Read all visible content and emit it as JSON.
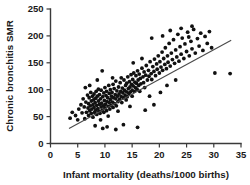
{
  "chart_data": {
    "type": "scatter",
    "title": "",
    "xlabel": "Infant mortality (deaths/1000 births)",
    "ylabel": "Chronic bronchitis SMR",
    "xlim": [
      0,
      35
    ],
    "ylim": [
      0,
      250
    ],
    "xticks": [
      0,
      5,
      10,
      15,
      20,
      25,
      30,
      35
    ],
    "yticks": [
      0,
      50,
      100,
      150,
      200,
      250
    ],
    "grid": false,
    "legend": null,
    "point_color": "#111111",
    "line_color": "#4a4a4a",
    "marker_size": 1.9,
    "fit_line": {
      "label": "linear regression",
      "x_start": 3.4,
      "y_start": 28,
      "x_end": 33.2,
      "y_end": 192
    },
    "points": [
      [
        3.6,
        47
      ],
      [
        4.6,
        52
      ],
      [
        5.2,
        64
      ],
      [
        5.6,
        72
      ],
      [
        5.8,
        57
      ],
      [
        6.0,
        83
      ],
      [
        6.2,
        68
      ],
      [
        6.3,
        46
      ],
      [
        6.5,
        77
      ],
      [
        6.6,
        58
      ],
      [
        6.8,
        90
      ],
      [
        6.9,
        66
      ],
      [
        7.0,
        74
      ],
      [
        7.0,
        52
      ],
      [
        7.1,
        85
      ],
      [
        7.2,
        61
      ],
      [
        7.3,
        70
      ],
      [
        7.4,
        95
      ],
      [
        7.5,
        56
      ],
      [
        7.5,
        79
      ],
      [
        7.6,
        64
      ],
      [
        7.7,
        88
      ],
      [
        7.8,
        72
      ],
      [
        7.8,
        49
      ],
      [
        7.9,
        81
      ],
      [
        8.0,
        67
      ],
      [
        8.0,
        92
      ],
      [
        8.1,
        58
      ],
      [
        8.2,
        76
      ],
      [
        8.3,
        84
      ],
      [
        8.3,
        62
      ],
      [
        8.4,
        97
      ],
      [
        8.5,
        71
      ],
      [
        8.5,
        54
      ],
      [
        8.6,
        88
      ],
      [
        8.7,
        65
      ],
      [
        8.8,
        79
      ],
      [
        8.8,
        101
      ],
      [
        8.9,
        60
      ],
      [
        9.0,
        73
      ],
      [
        9.0,
        91
      ],
      [
        9.1,
        56
      ],
      [
        9.2,
        83
      ],
      [
        9.3,
        68
      ],
      [
        9.3,
        99
      ],
      [
        9.4,
        75
      ],
      [
        9.5,
        62
      ],
      [
        9.5,
        135
      ],
      [
        9.6,
        87
      ],
      [
        9.7,
        70
      ],
      [
        9.8,
        94
      ],
      [
        9.8,
        58
      ],
      [
        9.9,
        80
      ],
      [
        10.0,
        66
      ],
      [
        10.0,
        104
      ],
      [
        10.1,
        73
      ],
      [
        10.2,
        89
      ],
      [
        10.3,
        61
      ],
      [
        10.3,
        97
      ],
      [
        10.4,
        78
      ],
      [
        10.5,
        85
      ],
      [
        10.6,
        69
      ],
      [
        10.7,
        108
      ],
      [
        10.8,
        76
      ],
      [
        10.8,
        93
      ],
      [
        10.9,
        64
      ],
      [
        11.0,
        82
      ],
      [
        11.0,
        100
      ],
      [
        11.1,
        71
      ],
      [
        11.2,
        88
      ],
      [
        11.3,
        95
      ],
      [
        11.4,
        77
      ],
      [
        11.5,
        110
      ],
      [
        11.5,
        67
      ],
      [
        11.6,
        85
      ],
      [
        11.7,
        102
      ],
      [
        11.8,
        74
      ],
      [
        11.9,
        91
      ],
      [
        12.0,
        83
      ],
      [
        12.0,
        116
      ],
      [
        12.1,
        70
      ],
      [
        12.2,
        98
      ],
      [
        12.3,
        88
      ],
      [
        12.4,
        78
      ],
      [
        12.5,
        105
      ],
      [
        12.6,
        92
      ],
      [
        12.7,
        82
      ],
      [
        12.8,
        113
      ],
      [
        12.9,
        97
      ],
      [
        13.0,
        87
      ],
      [
        13.0,
        122
      ],
      [
        13.1,
        76
      ],
      [
        13.2,
        103
      ],
      [
        13.3,
        94
      ],
      [
        13.4,
        85
      ],
      [
        13.5,
        118
      ],
      [
        13.6,
        99
      ],
      [
        13.7,
        90
      ],
      [
        13.8,
        108
      ],
      [
        13.9,
        81
      ],
      [
        14.0,
        112
      ],
      [
        14.0,
        96
      ],
      [
        14.1,
        87
      ],
      [
        14.2,
        124
      ],
      [
        14.3,
        102
      ],
      [
        14.4,
        93
      ],
      [
        14.5,
        115
      ],
      [
        14.6,
        105
      ],
      [
        14.7,
        96
      ],
      [
        14.8,
        128
      ],
      [
        14.9,
        110
      ],
      [
        15.0,
        99
      ],
      [
        15.0,
        88
      ],
      [
        15.1,
        119
      ],
      [
        15.2,
        107
      ],
      [
        15.3,
        131
      ],
      [
        15.4,
        97
      ],
      [
        15.5,
        114
      ],
      [
        15.6,
        104
      ],
      [
        15.7,
        126
      ],
      [
        15.8,
        112
      ],
      [
        15.9,
        101
      ],
      [
        16.0,
        135
      ],
      [
        16.1,
        118
      ],
      [
        16.2,
        108
      ],
      [
        16.3,
        129
      ],
      [
        16.4,
        97
      ],
      [
        16.5,
        121
      ],
      [
        16.6,
        111
      ],
      [
        16.8,
        140
      ],
      [
        17.0,
        124
      ],
      [
        17.1,
        113
      ],
      [
        17.2,
        133
      ],
      [
        17.3,
        104
      ],
      [
        17.5,
        127
      ],
      [
        17.6,
        145
      ],
      [
        17.8,
        118
      ],
      [
        18.0,
        136
      ],
      [
        18.1,
        125
      ],
      [
        18.3,
        152
      ],
      [
        18.5,
        130
      ],
      [
        18.6,
        119
      ],
      [
        18.8,
        143
      ],
      [
        19.0,
        134
      ],
      [
        19.1,
        157
      ],
      [
        19.3,
        126
      ],
      [
        19.5,
        148
      ],
      [
        19.6,
        138
      ],
      [
        19.8,
        163
      ],
      [
        20.0,
        131
      ],
      [
        20.1,
        152
      ],
      [
        20.3,
        142
      ],
      [
        20.5,
        170
      ],
      [
        20.6,
        136
      ],
      [
        20.8,
        158
      ],
      [
        21.0,
        147
      ],
      [
        21.1,
        178
      ],
      [
        21.3,
        139
      ],
      [
        21.5,
        163
      ],
      [
        21.6,
        151
      ],
      [
        21.8,
        186
      ],
      [
        22.0,
        144
      ],
      [
        22.2,
        168
      ],
      [
        22.4,
        156
      ],
      [
        22.6,
        193
      ],
      [
        22.8,
        149
      ],
      [
        23.0,
        174
      ],
      [
        23.2,
        161
      ],
      [
        23.4,
        203
      ],
      [
        23.6,
        153
      ],
      [
        23.8,
        180
      ],
      [
        24.0,
        166
      ],
      [
        24.2,
        196
      ],
      [
        24.5,
        158
      ],
      [
        24.7,
        185
      ],
      [
        25.0,
        171
      ],
      [
        25.2,
        207
      ],
      [
        25.5,
        163
      ],
      [
        25.8,
        190
      ],
      [
        26.0,
        176
      ],
      [
        26.3,
        212
      ],
      [
        26.6,
        168
      ],
      [
        27.0,
        195
      ],
      [
        27.3,
        181
      ],
      [
        27.6,
        205
      ],
      [
        28.0,
        173
      ],
      [
        28.4,
        199
      ],
      [
        28.8,
        186
      ],
      [
        29.2,
        208
      ],
      [
        29.6,
        178
      ],
      [
        30.2,
        131
      ],
      [
        33.0,
        130
      ],
      [
        8.2,
        33
      ],
      [
        9.6,
        28
      ],
      [
        10.4,
        31
      ],
      [
        12.0,
        26
      ],
      [
        13.4,
        35
      ],
      [
        16.0,
        30
      ],
      [
        17.4,
        62
      ],
      [
        19.0,
        72
      ],
      [
        20.2,
        95
      ],
      [
        21.4,
        108
      ],
      [
        23.0,
        118
      ],
      [
        18.2,
        88
      ],
      [
        15.2,
        150
      ],
      [
        16.8,
        158
      ],
      [
        11.4,
        122
      ],
      [
        4.0,
        58
      ],
      [
        5.0,
        44
      ],
      [
        6.4,
        104
      ],
      [
        7.2,
        108
      ],
      [
        8.6,
        118
      ],
      [
        14.6,
        69
      ],
      [
        12.4,
        60
      ],
      [
        10.6,
        51
      ],
      [
        9.2,
        44
      ],
      [
        22.0,
        210
      ],
      [
        24.0,
        214
      ],
      [
        26.0,
        218
      ],
      [
        20.6,
        200
      ],
      [
        18.6,
        196
      ],
      [
        25.4,
        198
      ]
    ]
  }
}
